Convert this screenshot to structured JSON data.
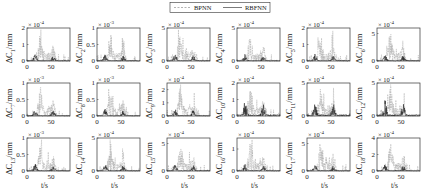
{
  "legend": {
    "items": [
      {
        "label": "BPNN",
        "style": "dashed",
        "color": "#9a9a9a"
      },
      {
        "label": "RBFNN",
        "style": "solid",
        "color": "#111111"
      }
    ]
  },
  "chart_data": {
    "type": "line",
    "layout": {
      "rows": 3,
      "cols": 6,
      "legend_position": "top-center",
      "grid": false
    },
    "xlabel": "t/s",
    "xlim": [
      0,
      90
    ],
    "xticks": [
      0,
      50
    ],
    "series_names": [
      "BPNN",
      "RBFNN"
    ],
    "subplots": [
      {
        "id": 1,
        "ylabel": "ΔC_1/mm",
        "sub": "1",
        "exponent": "×10^-4",
        "exp_base": "× 10",
        "exp_pow": "-4",
        "yticks": [
          "0",
          "1",
          "2"
        ],
        "ylim": [
          0,
          2
        ]
      },
      {
        "id": 2,
        "ylabel": "ΔC_2/mm",
        "sub": "2",
        "exponent": "×10^-3",
        "exp_base": "× 10",
        "exp_pow": "-3",
        "yticks": [
          "0",
          "0.5",
          "1"
        ],
        "ylim": [
          0,
          1
        ]
      },
      {
        "id": 3,
        "ylabel": "ΔC_3/mm",
        "sub": "3",
        "exponent": "×10^-4",
        "exp_base": "× 10",
        "exp_pow": "-4",
        "yticks": [
          "0",
          "5"
        ],
        "ylim": [
          0,
          5
        ]
      },
      {
        "id": 4,
        "ylabel": "ΔC_4/mm",
        "sub": "4",
        "exponent": "×10^-4",
        "exp_base": "× 10",
        "exp_pow": "-4",
        "yticks": [
          "0",
          "5"
        ],
        "ylim": [
          0,
          5
        ]
      },
      {
        "id": 5,
        "ylabel": "ΔC_5/mm",
        "sub": "5",
        "exponent": "×10^-4",
        "exp_base": "× 10",
        "exp_pow": "-4",
        "yticks": [
          "0",
          "1",
          "2"
        ],
        "ylim": [
          0,
          2
        ]
      },
      {
        "id": 6,
        "ylabel": "ΔC_6/mm",
        "sub": "6",
        "exponent": "×10^-4",
        "exp_base": "× 10",
        "exp_pow": "-4",
        "yticks": [
          "0",
          "5"
        ],
        "ylim": [
          0,
          6
        ]
      },
      {
        "id": 7,
        "ylabel": "ΔC_7/mm",
        "sub": "7",
        "exponent": "×10^-3",
        "exp_base": "× 10",
        "exp_pow": "-3",
        "yticks": [
          "0",
          "0.5",
          "1"
        ],
        "ylim": [
          0,
          1
        ]
      },
      {
        "id": 8,
        "ylabel": "ΔC_8/mm",
        "sub": "8",
        "exponent": "×10^-3",
        "exp_base": "× 10",
        "exp_pow": "-3",
        "yticks": [
          "0",
          "0.5",
          "1"
        ],
        "ylim": [
          0,
          1
        ]
      },
      {
        "id": 9,
        "ylabel": "ΔC_9/mm",
        "sub": "9",
        "exponent": "×10^-4",
        "exp_base": "× 10",
        "exp_pow": "-4",
        "yticks": [
          "0",
          "1",
          "2"
        ],
        "ylim": [
          0,
          2.5
        ]
      },
      {
        "id": 10,
        "ylabel": "ΔC_10/mm",
        "sub": "10",
        "exponent": "×10^-4",
        "exp_base": "× 10",
        "exp_pow": "-4",
        "yticks": [
          "0",
          "1",
          "2"
        ],
        "ylim": [
          0,
          2
        ]
      },
      {
        "id": 11,
        "ylabel": "ΔC_11/mm",
        "sub": "11",
        "exponent": "×10^-4",
        "exp_base": "× 10",
        "exp_pow": "-4",
        "yticks": [
          "0",
          "5"
        ],
        "ylim": [
          0,
          5
        ]
      },
      {
        "id": 12,
        "ylabel": "ΔC_12/mm",
        "sub": "12",
        "exponent": "×10^-4",
        "exp_base": "× 10",
        "exp_pow": "-4",
        "yticks": [
          "0",
          "5"
        ],
        "ylim": [
          0,
          5
        ]
      },
      {
        "id": 13,
        "ylabel": "ΔC_13/mm",
        "sub": "13",
        "exponent": "×10^-3",
        "exp_base": "× 10",
        "exp_pow": "-3",
        "yticks": [
          "0",
          "0.5",
          "1"
        ],
        "ylim": [
          0,
          1
        ]
      },
      {
        "id": 14,
        "ylabel": "ΔC_14/mm",
        "sub": "14",
        "exponent": "×10^-4",
        "exp_base": "× 10",
        "exp_pow": "-4",
        "yticks": [
          "0",
          "5"
        ],
        "ylim": [
          0,
          5
        ]
      },
      {
        "id": 15,
        "ylabel": "ΔC_15/mm",
        "sub": "15",
        "exponent": "×10^-4",
        "exp_base": "× 10",
        "exp_pow": "-4",
        "yticks": [
          "0",
          "5"
        ],
        "ylim": [
          0,
          6
        ]
      },
      {
        "id": 16,
        "ylabel": "ΔC_16/mm",
        "sub": "16",
        "exponent": "×10^-4",
        "exp_base": "× 10",
        "exp_pow": "-4",
        "yticks": [
          "0",
          "1"
        ],
        "ylim": [
          0,
          1.5
        ]
      },
      {
        "id": 17,
        "ylabel": "ΔC_17/mm",
        "sub": "17",
        "exponent": "×10^-4",
        "exp_base": "× 10",
        "exp_pow": "-4",
        "yticks": [
          "0",
          "5"
        ],
        "ylim": [
          0,
          6
        ]
      },
      {
        "id": 18,
        "ylabel": "ΔC_18/mm",
        "sub": "18",
        "exponent": "×10^-4",
        "exp_base": "× 10",
        "exp_pow": "-4",
        "yticks": [
          "0",
          "2",
          "4"
        ],
        "ylim": [
          0,
          4
        ]
      }
    ]
  }
}
